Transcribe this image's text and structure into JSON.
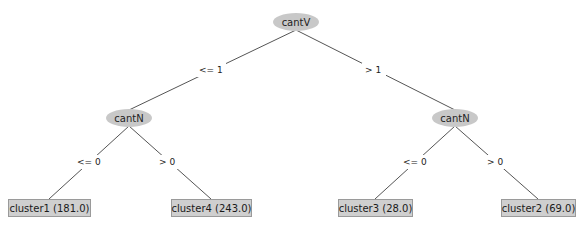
{
  "tree": {
    "root": {
      "id": "root",
      "label": "cantV",
      "children": [
        {
          "edge_label": "<= 1",
          "node": {
            "id": "left",
            "label": "cantN",
            "children": [
              {
                "edge_label": "<= 0",
                "node": {
                  "id": "leaf1",
                  "label": "cluster1 (181.0)",
                  "leaf": true
                }
              },
              {
                "edge_label": "> 0",
                "node": {
                  "id": "leaf4",
                  "label": "cluster4 (243.0)",
                  "leaf": true
                }
              }
            ]
          }
        },
        {
          "edge_label": "> 1",
          "node": {
            "id": "right",
            "label": "cantN",
            "children": [
              {
                "edge_label": "<= 0",
                "node": {
                  "id": "leaf3",
                  "label": "cluster3 (28.0)",
                  "leaf": true
                }
              },
              {
                "edge_label": "> 0",
                "node": {
                  "id": "leaf2",
                  "label": "cluster2 (69.0)",
                  "leaf": true
                }
              }
            ]
          }
        }
      ]
    }
  },
  "labels": {
    "root": "cantV",
    "left": "cantN",
    "right": "cantN",
    "edge_root_left": "<= 1",
    "edge_root_right": "> 1",
    "edge_left_leaf1": "<= 0",
    "edge_left_leaf4": "> 0",
    "edge_right_leaf3": "<= 0",
    "edge_right_leaf2": "> 0",
    "leaf1": "cluster1 (181.0)",
    "leaf4": "cluster4 (243.0)",
    "leaf3": "cluster3 (28.0)",
    "leaf2": "cluster2 (69.0)"
  },
  "colors": {
    "node_fill": "#c8c8c8",
    "leaf_fill": "#cfcfcf",
    "edge": "#555555"
  }
}
